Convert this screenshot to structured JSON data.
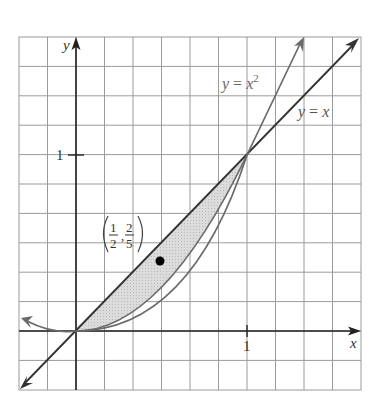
{
  "figure": {
    "axes": {
      "x_label": "x",
      "y_label": "y",
      "x_tick_label": "1",
      "y_tick_label": "1"
    },
    "curves": [
      {
        "label_parts": [
          "y",
          " = ",
          "x",
          "2"
        ],
        "equation": "y = x^2"
      },
      {
        "label_parts": [
          "y",
          " = ",
          "x"
        ],
        "equation": "y = x"
      }
    ],
    "centroid": {
      "label_x_num": "1",
      "label_x_den": "2",
      "label_y_num": "2",
      "label_y_den": "5",
      "x": 0.5,
      "y": 0.4
    },
    "shaded_region": "between y = x and y = x^2 for 0 <= x <= 1",
    "colors": {
      "grid": "#9a9a9a",
      "axis": "#222222",
      "line": "#333333",
      "parabola": "#6a6a6a",
      "shade": "#d6d6d6",
      "dot": "#000000"
    }
  }
}
